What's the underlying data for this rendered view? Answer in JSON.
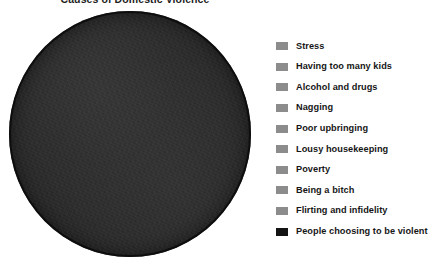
{
  "chart_data": {
    "type": "pie",
    "title": "Causes of Domestic Violence",
    "xlabel": "",
    "ylabel": "",
    "legend_position": "right",
    "grid": false,
    "categories": [
      "Stress",
      "Having too many kids",
      "Alcohol and drugs",
      "Nagging",
      "Poor upbringing",
      "Lousy housekeeping",
      "Poverty",
      "Being a bitch",
      "Flirting and infidelity",
      "People choosing to be violent"
    ],
    "values": [
      0,
      0,
      0,
      0,
      0,
      0,
      0,
      0,
      0,
      100
    ],
    "slice_colors": [
      "#8c8c8c",
      "#8c8c8c",
      "#8c8c8c",
      "#8c8c8c",
      "#8c8c8c",
      "#8c8c8c",
      "#8c8c8c",
      "#8c8c8c",
      "#8c8c8c",
      "#141414"
    ]
  },
  "chart": {
    "title": "Causes of Domestic Violence",
    "pie_name": "pie-single-slice"
  },
  "legend": {
    "items": [
      {
        "label": "Stress",
        "color": "#8c8c8c"
      },
      {
        "label": "Having too many kids",
        "color": "#8c8c8c"
      },
      {
        "label": "Alcohol and drugs",
        "color": "#8c8c8c"
      },
      {
        "label": "Nagging",
        "color": "#8c8c8c"
      },
      {
        "label": "Poor upbringing",
        "color": "#8c8c8c"
      },
      {
        "label": "Lousy housekeeping",
        "color": "#8c8c8c"
      },
      {
        "label": "Poverty",
        "color": "#8c8c8c"
      },
      {
        "label": "Being a bitch",
        "color": "#8c8c8c"
      },
      {
        "label": "Flirting and infidelity",
        "color": "#8c8c8c"
      },
      {
        "label": "People choosing to be violent",
        "color": "#141414"
      }
    ]
  },
  "colors": {
    "background": "#ffffff",
    "pie_fill": "#2a2a2a",
    "text": "#161616",
    "swatch_gray": "#8c8c8c",
    "swatch_black": "#141414"
  }
}
